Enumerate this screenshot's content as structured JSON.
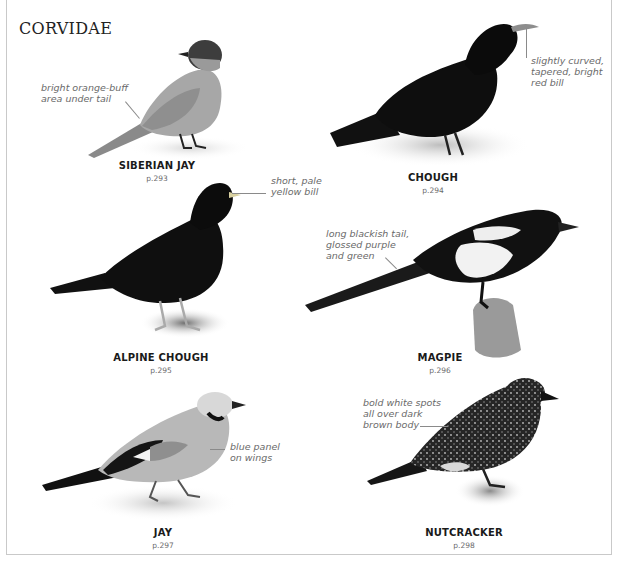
{
  "page": {
    "title": "CORVIDAE"
  },
  "birds": [
    {
      "name": "SIBERIAN JAY",
      "page_ref": "p.293",
      "annotation": "bright orange-buff\narea under tail"
    },
    {
      "name": "CHOUGH",
      "page_ref": "p.294",
      "annotation": "slightly curved,\ntapered, bright\nred bill"
    },
    {
      "name": "ALPINE CHOUGH",
      "page_ref": "p.295",
      "annotation": "short, pale\nyellow bill"
    },
    {
      "name": "MAGPIE",
      "page_ref": "p.296",
      "annotation": "long blackish tail,\nglossed purple\nand green"
    },
    {
      "name": "JAY",
      "page_ref": "p.297",
      "annotation": "blue panel\non wings"
    },
    {
      "name": "NUTCRACKER",
      "page_ref": "p.298",
      "annotation": "bold white spots\nall over dark\nbrown body"
    }
  ],
  "colors": {
    "text_dark": "#1a1a1a",
    "annotation_grey": "#6a6a6a",
    "frame_grey": "#c9c9c9"
  }
}
